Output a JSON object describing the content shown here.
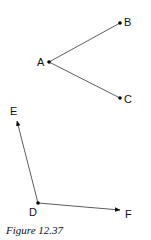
{
  "figure": {
    "caption": "Figure 12.37",
    "colors": {
      "line": "#333333",
      "point": "#000000",
      "text": "#111111"
    },
    "angle1": {
      "vertex": {
        "label": "A",
        "x": 49,
        "y": 62,
        "label_x": 37,
        "label_y": 66
      },
      "rays": [
        {
          "label": "B",
          "x": 120,
          "y": 23,
          "label_x": 124,
          "label_y": 26,
          "endpoint": "dot"
        },
        {
          "label": "C",
          "x": 120,
          "y": 98,
          "label_x": 124,
          "label_y": 103,
          "endpoint": "dot"
        }
      ]
    },
    "angle2": {
      "vertex": {
        "label": "D",
        "x": 38,
        "y": 203,
        "label_x": 29,
        "label_y": 216
      },
      "rays": [
        {
          "label": "E",
          "x": 17,
          "y": 120,
          "label_x": 10,
          "label_y": 115,
          "endpoint": "arrow"
        },
        {
          "label": "F",
          "x": 120,
          "y": 210,
          "label_x": 125,
          "label_y": 218,
          "endpoint": "arrow"
        }
      ]
    }
  }
}
